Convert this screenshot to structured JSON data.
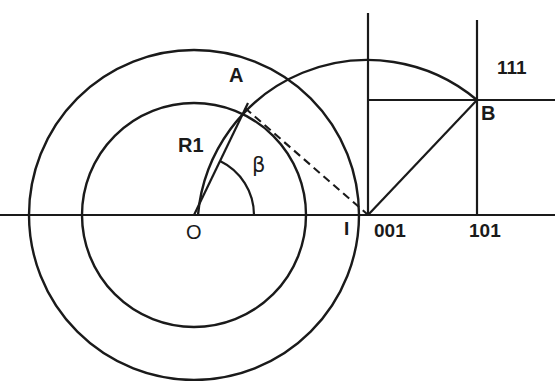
{
  "figure": {
    "type": "geometry-diagram",
    "stroke_color": "#1a1a1a",
    "background_color": "#ffffff",
    "labels": {
      "point_a": "A",
      "radius_r1": "R1",
      "angle_beta": "β",
      "center_o": "O",
      "point_i": "I",
      "index_001": "001",
      "index_101": "101",
      "index_111": "111",
      "point_b": "B"
    },
    "geometry": {
      "center_o": {
        "x": 194,
        "y": 215
      },
      "outer_circle_radius": 165,
      "inner_circle_radius": 112,
      "projection_center": {
        "x": 368,
        "y": 215
      },
      "projection_arc_radius": 170,
      "point_a": {
        "x": 245,
        "y": 108
      },
      "point_b": {
        "x": 477,
        "y": 100
      },
      "axis_y": 215,
      "beta_arc_radius": 60,
      "vertical_line_001_x": 368,
      "vertical_line_101_x": 477
    }
  }
}
